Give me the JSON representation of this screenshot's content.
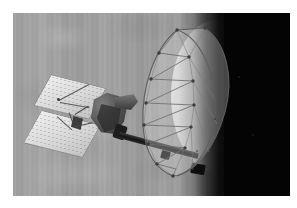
{
  "image": {
    "kind": "photograph",
    "subject": "spacecraft-with-deployed-mesh-antenna-in-orbit",
    "palette": "grayscale",
    "alt_text": "Black-and-white artist concept of a spacecraft with solar panels and a large deployed mesh dish antenna on a boom, above a cloud-banded planet with a bright limb fading to black space.",
    "border_color": "#ffffff",
    "space_color": "#040404",
    "planet_color": "#9e9e9e",
    "limb_highlight_color": "#e7e7e7",
    "structure_color": "#3d3d3d"
  },
  "scene": {
    "background_label": "planet-surface-with-vertical-cloud-bands",
    "terminator_label": "day-night-terminator",
    "space_label": "deep-space-black",
    "limb_label": "bright-planet-limb"
  },
  "spacecraft": {
    "name_label": "spacecraft",
    "parts": [
      {
        "id": "panel-upper",
        "label": "upper-solar-panel"
      },
      {
        "id": "panel-lower",
        "label": "lower-solar-panel"
      },
      {
        "id": "bus",
        "label": "spacecraft-bus"
      },
      {
        "id": "feed",
        "label": "antenna-feed-horn"
      },
      {
        "id": "instrument",
        "label": "instrument-package"
      },
      {
        "id": "mast",
        "label": "magnetometer-mast"
      },
      {
        "id": "boom",
        "label": "antenna-support-boom"
      },
      {
        "id": "dish",
        "label": "deployed-mesh-dish-antenna"
      }
    ]
  },
  "dish": {
    "label": "deployed-mesh-dish-antenna",
    "rib_count": 12,
    "node_count": 13,
    "rim_outline": "M 44,6 C 22,24 8,62 10,102 C 12,130 24,146 40,152 C 62,150 82,124 92,88 C 102,52 92,18 72,4 Z",
    "rim_back": "M 44,6 C 64,12 80,40 82,76 C 84,112 70,142 44,152",
    "ribs": [
      "M 44,6 L 26,29",
      "M 26,29 L 56,33",
      "M 56,33 L 18,55",
      "M 18,55 L 60,57",
      "M 60,57 L 13,79",
      "M 13,79 L 61,81",
      "M 61,81 L 11,101",
      "M 11,101 L 58,103",
      "M 58,103 L 15,120",
      "M 15,120 L 52,124",
      "M 52,124 L 24,140",
      "M 24,140 L 43,145",
      "M 43,145 L 40,152"
    ],
    "web_lines": [
      "M 44,6 L 56,33",
      "M 56,33 L 60,57",
      "M 60,57 L 61,81",
      "M 61,81 L 58,103",
      "M 58,103 L 52,124",
      "M 52,124 L 43,145",
      "M 26,29 L 18,55",
      "M 18,55 L 13,79",
      "M 13,79 L 11,101",
      "M 11,101 L 15,120",
      "M 15,120 L 24,140",
      "M 24,140 L 40,152",
      "M 72,4 L 56,33",
      "M 56,33 L 82,76",
      "M 60,57 L 84,100",
      "M 61,81 L 76,128",
      "M 58,103 L 60,146"
    ],
    "nodes": [
      [
        44,
        6
      ],
      [
        26,
        29
      ],
      [
        56,
        33
      ],
      [
        18,
        55
      ],
      [
        60,
        57
      ],
      [
        13,
        79
      ],
      [
        61,
        81
      ],
      [
        11,
        101
      ],
      [
        58,
        103
      ],
      [
        15,
        120
      ],
      [
        52,
        124
      ],
      [
        24,
        140
      ],
      [
        40,
        152
      ],
      [
        72,
        4
      ]
    ]
  },
  "specks": [
    {
      "x": 214,
      "y": 118,
      "size": 2
    },
    {
      "x": 238,
      "y": 76,
      "size": 1.5
    },
    {
      "x": 196,
      "y": 150,
      "size": 1.5
    },
    {
      "x": 252,
      "y": 134,
      "size": 1.5
    }
  ]
}
